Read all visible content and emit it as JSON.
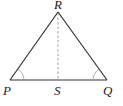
{
  "diagram": {
    "type": "triangle",
    "stroke_color": "#333333",
    "dashed_color": "#888888",
    "points": {
      "P": {
        "x": 10,
        "y": 80
      },
      "Q": {
        "x": 107,
        "y": 80
      },
      "R": {
        "x": 58,
        "y": 12
      },
      "S": {
        "x": 58,
        "y": 80
      }
    },
    "labels": {
      "P": "P",
      "Q": "Q",
      "R": "R",
      "S": "S"
    },
    "segments": [
      {
        "from": "P",
        "to": "R",
        "style": "solid"
      },
      {
        "from": "R",
        "to": "Q",
        "style": "solid"
      },
      {
        "from": "P",
        "to": "Q",
        "style": "solid"
      },
      {
        "from": "R",
        "to": "S",
        "style": "dashed"
      }
    ],
    "angle_marks": [
      "P",
      "Q"
    ]
  }
}
